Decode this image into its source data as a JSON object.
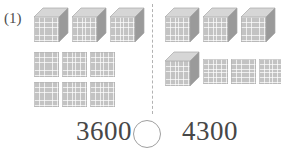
{
  "problem": {
    "number_label": "(1)",
    "type": "base-ten-blocks-comparison"
  },
  "divider": {
    "style": "dashed-vertical",
    "color": "#b2b2b2"
  },
  "groups": [
    {
      "side": "left",
      "total": 3600,
      "thousand_cubes": 3,
      "hundred_flats": 6,
      "rows": [
        {
          "kind": "cubes",
          "count": 3
        },
        {
          "kind": "flats",
          "count": 3
        },
        {
          "kind": "flats",
          "count": 3
        }
      ]
    },
    {
      "side": "right",
      "total": 4300,
      "thousand_cubes": 4,
      "hundred_flats": 3,
      "rows": [
        {
          "kind": "cubes",
          "count": 3
        },
        {
          "kind": "mixed",
          "cubes": 1,
          "flats": 3
        }
      ]
    }
  ],
  "comparison": {
    "left_value": "3600",
    "right_value": "4300",
    "operator": "",
    "operator_placeholder_shape": "circle"
  },
  "colors": {
    "block_face": "#c3c3c3",
    "block_top": "#d6d6d6",
    "block_side": "#9a9a9a",
    "block_outline": "#a8a8a8",
    "text": "#474747",
    "label_text": "#4d4d4d",
    "divider": "#b2b2b2",
    "circle_stroke": "#9f9f9f",
    "background": "#ffffff"
  }
}
